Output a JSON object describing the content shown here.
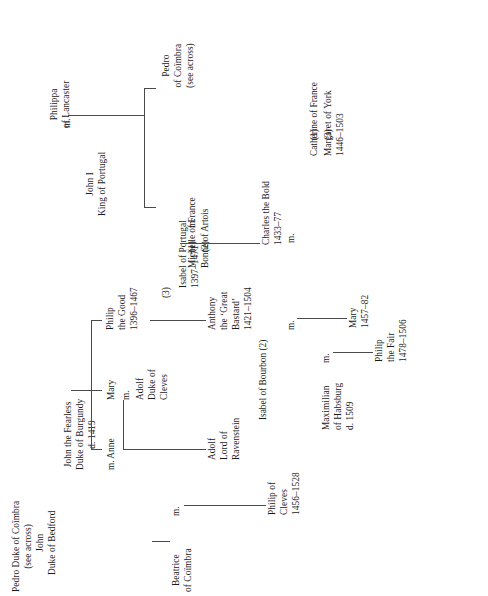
{
  "chart": {
    "type": "genealogy-tree",
    "orientation": "rotated-90-ccw",
    "persons": {
      "philippa": {
        "lines": [
          "Philippa",
          "of Lancaster"
        ]
      },
      "john_i": {
        "lines": [
          "John I",
          "King of Portugal"
        ]
      },
      "pedro_coimbra": {
        "lines": [
          "Pedro",
          "of Coïmbra",
          "(see across)"
        ]
      },
      "isabel_portugal": {
        "lines": [
          "Isabel of Portugal",
          "1397–1471"
        ]
      },
      "michelle": {
        "lines": [
          "Michelle of France"
        ]
      },
      "bonne": {
        "lines": [
          "Bonne of Artois"
        ]
      },
      "catherine": {
        "lines": [
          "Catherine of France"
        ]
      },
      "margaret_york": {
        "lines": [
          "Margaret of York",
          "1446–1503"
        ]
      },
      "charles_bold": {
        "lines": [
          "Charles the Bold",
          "1433–77"
        ]
      },
      "john_fearless": {
        "lines": [
          "John the Fearless",
          "Duke of Burgundy",
          "d. 1419"
        ]
      },
      "philip_good": {
        "lines": [
          "Philip",
          "the Good",
          "1396–1467"
        ]
      },
      "mary_burgundy": {
        "lines": [
          "Mary"
        ]
      },
      "adolf_cleves": {
        "lines": [
          "Adolf",
          "Duke of",
          "Cleves"
        ]
      },
      "anne": {
        "lines": [
          "Anne"
        ]
      },
      "anthony": {
        "lines": [
          "Anthony",
          "the ‘Great",
          "Bastard’",
          "1421–1504"
        ]
      },
      "adolf_ravenstein": {
        "lines": [
          "Adolf",
          "Lord of",
          "Ravenstein"
        ]
      },
      "isabel_bourbon": {
        "lines": [
          "Isabel of Bourbon (2)"
        ]
      },
      "mary_1457": {
        "lines": [
          "Mary",
          "1457–82"
        ]
      },
      "maximilian": {
        "lines": [
          "Maximilian",
          "of Habsburg",
          "d. 1509"
        ]
      },
      "philip_fair": {
        "lines": [
          "Philip",
          "the Fair",
          "1478–1506"
        ]
      },
      "john_bedford": {
        "lines": [
          "John",
          "Duke of Bedford"
        ]
      },
      "pedro_duke": {
        "lines": [
          "Pedro Duke of Coïmbra",
          "(see across)"
        ]
      },
      "beatrice": {
        "lines": [
          "Beatrice",
          "of Coïmbra"
        ]
      },
      "philip_cleves": {
        "lines": [
          "Philip of",
          "Cleves",
          "1456–1528"
        ]
      }
    },
    "markers": {
      "m_philippa": "m.",
      "m_burgundy_wives": "m.",
      "m_charles": "m.",
      "m_anne": "m. Anne",
      "m_mary_adolf": "m.",
      "m_isabel_bourbon": "m.",
      "m_maximilian": "m.",
      "m_beatrice": "m."
    },
    "ordinals": {
      "michelle": "(1)",
      "bonne": "(2)",
      "isabel_portugal": "(3)",
      "catherine": "(1)",
      "margaret_york": "(3)"
    },
    "colors": {
      "ink": "#1a1a1a",
      "rule": "#4a4a4a",
      "background": "#ffffff"
    }
  }
}
